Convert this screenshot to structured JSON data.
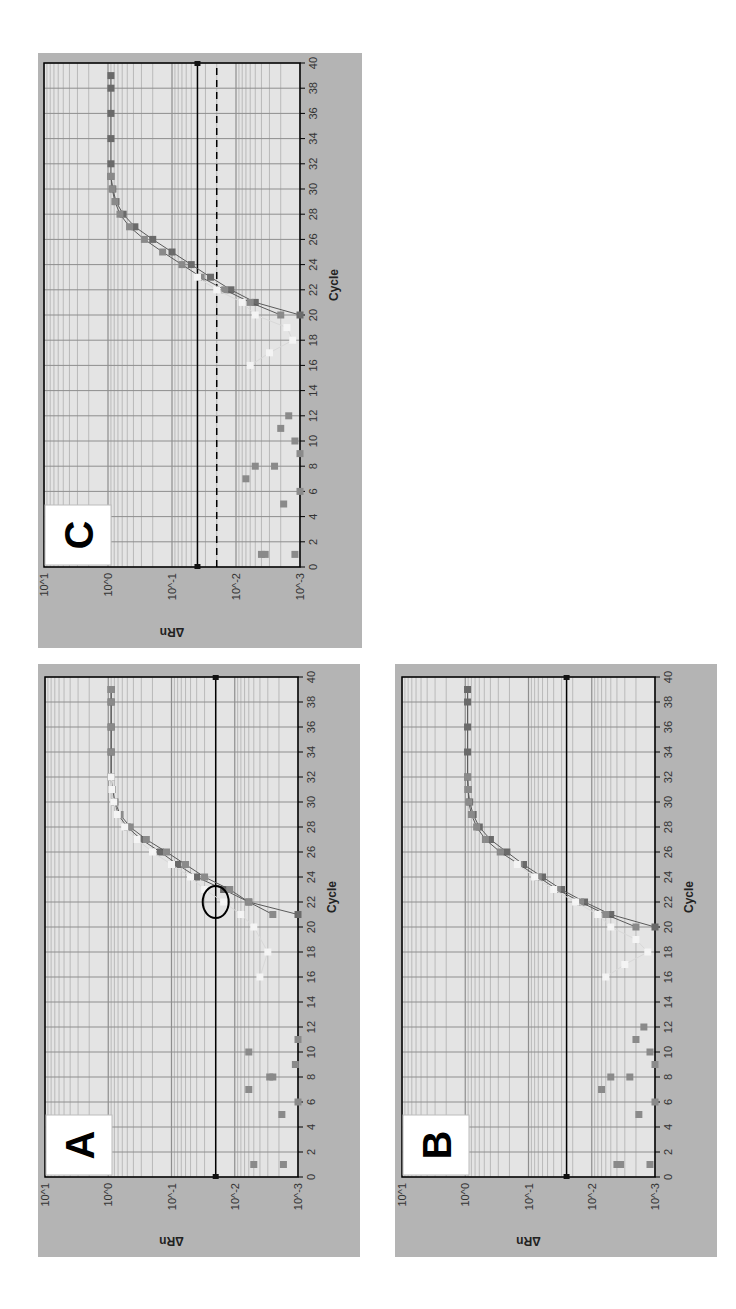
{
  "figure": {
    "panels": [
      {
        "id": "C",
        "label": "C",
        "x": 38,
        "y": 53,
        "w": 324,
        "h": 595,
        "thresholds": [
          {
            "value": 0.04,
            "style": "solid"
          },
          {
            "value": 0.02,
            "style": "dashed"
          }
        ],
        "annotation": null
      },
      {
        "id": "A",
        "label": "A",
        "x": 38,
        "y": 664,
        "w": 322,
        "h": 593,
        "thresholds": [
          {
            "value": 0.02,
            "style": "solid"
          }
        ],
        "annotation": {
          "type": "ellipse",
          "cycle": 22,
          "value": 0.02
        }
      },
      {
        "id": "B",
        "label": "B",
        "x": 395,
        "y": 664,
        "w": 322,
        "h": 593,
        "thresholds": [
          {
            "value": 0.025,
            "style": "solid"
          }
        ],
        "annotation": null
      }
    ],
    "axis_text": {
      "xlabel": "Cycle",
      "ylabel": "ΔRn",
      "xticks": [
        "0",
        "2",
        "4",
        "6",
        "8",
        "10",
        "12",
        "14",
        "16",
        "18",
        "20",
        "22",
        "24",
        "26",
        "28",
        "30",
        "32",
        "34",
        "36",
        "38",
        "40"
      ],
      "yticks": [
        "10^-3",
        "10^-2",
        "10^-1",
        "10^0",
        "10^1"
      ]
    },
    "colors": {
      "frame": "#b4b4b4",
      "plot_bg": "#e4e4e4",
      "grid": "#8e8e8e",
      "minor_grid": "#a8a8a8",
      "series_dark": "#6a6a6a",
      "series_mid": "#8a8a8a",
      "series_light": "#f4f4f4",
      "threshold": "#000000"
    }
  },
  "chart_data": [
    {
      "panel": "A",
      "type": "line",
      "title": "A",
      "xlabel": "Cycle",
      "ylabel": "ΔRn",
      "xlim": [
        0,
        40
      ],
      "ylim": [
        0.001,
        10
      ],
      "yscale": "log",
      "grid": true,
      "threshold": 0.02,
      "annotation": "ellipse near cycle 22 at threshold crossing",
      "series": [
        {
          "name": "sample 1",
          "x": [
            21,
            22,
            23,
            24,
            25,
            26,
            27,
            28,
            29,
            30,
            31,
            32,
            34,
            36,
            38,
            39
          ],
          "values": [
            0.001,
            0.006,
            0.015,
            0.04,
            0.08,
            0.15,
            0.3,
            0.5,
            0.7,
            0.8,
            0.88,
            0.9,
            0.9,
            0.9,
            0.9,
            0.9
          ]
        },
        {
          "name": "sample 2",
          "x": [
            21,
            22,
            23,
            24,
            25,
            26,
            27,
            28,
            29,
            30,
            31,
            32,
            34,
            36,
            38,
            39
          ],
          "values": [
            0.0025,
            0.006,
            0.012,
            0.03,
            0.06,
            0.12,
            0.25,
            0.45,
            0.65,
            0.78,
            0.86,
            0.9,
            0.9,
            0.9,
            0.9,
            0.9
          ]
        },
        {
          "name": "sample 3",
          "x": [
            16,
            18,
            20,
            21,
            22,
            23,
            24,
            25,
            26,
            27,
            28,
            29,
            30,
            31,
            32
          ],
          "values": [
            0.004,
            0.003,
            0.005,
            0.008,
            0.015,
            0.03,
            0.05,
            0.1,
            0.2,
            0.35,
            0.55,
            0.72,
            0.82,
            0.88,
            0.9
          ]
        },
        {
          "name": "early noise",
          "x": [
            1,
            1,
            5,
            6,
            7,
            8,
            8,
            9,
            10,
            11
          ],
          "values": [
            0.005,
            0.0017,
            0.0018,
            0.001,
            0.006,
            0.0025,
            0.0028,
            0.0011,
            0.006,
            0.001
          ]
        }
      ]
    },
    {
      "panel": "B",
      "type": "line",
      "title": "B",
      "xlabel": "Cycle",
      "ylabel": "ΔRn",
      "xlim": [
        0,
        40
      ],
      "ylim": [
        0.001,
        10
      ],
      "yscale": "log",
      "grid": true,
      "threshold": 0.025,
      "series": [
        {
          "name": "sample 1",
          "x": [
            20,
            21,
            22,
            23,
            24,
            25,
            26,
            27,
            28,
            29,
            30,
            31,
            32,
            34,
            36,
            38,
            39
          ],
          "values": [
            0.001,
            0.005,
            0.013,
            0.03,
            0.06,
            0.12,
            0.22,
            0.4,
            0.6,
            0.75,
            0.85,
            0.9,
            0.92,
            0.92,
            0.92,
            0.92,
            0.92
          ]
        },
        {
          "name": "sample 2",
          "x": [
            20,
            21,
            22,
            23,
            24,
            25,
            26,
            27,
            28,
            29,
            30,
            31,
            32
          ],
          "values": [
            0.002,
            0.006,
            0.015,
            0.035,
            0.07,
            0.14,
            0.28,
            0.48,
            0.66,
            0.8,
            0.88,
            0.9,
            0.92
          ]
        },
        {
          "name": "sample 3",
          "x": [
            16,
            17,
            18,
            19,
            20,
            21,
            22,
            23,
            24,
            25
          ],
          "values": [
            0.006,
            0.003,
            0.0013,
            0.002,
            0.005,
            0.008,
            0.018,
            0.04,
            0.08,
            0.15
          ]
        },
        {
          "name": "early noise",
          "x": [
            1,
            1,
            1,
            5,
            6,
            7,
            8,
            8,
            9,
            10,
            11,
            12
          ],
          "values": [
            0.004,
            0.0035,
            0.0012,
            0.0018,
            0.001,
            0.007,
            0.0025,
            0.005,
            0.001,
            0.0012,
            0.002,
            0.0015
          ]
        }
      ]
    },
    {
      "panel": "C",
      "type": "line",
      "title": "C",
      "xlabel": "Cycle",
      "ylabel": "ΔRn",
      "xlim": [
        0,
        40
      ],
      "ylim": [
        0.001,
        10
      ],
      "yscale": "log",
      "grid": true,
      "thresholds": [
        0.04,
        0.02
      ],
      "series": [
        {
          "name": "sample 1",
          "x": [
            20,
            21,
            22,
            23,
            24,
            25,
            26,
            27,
            28,
            29,
            30,
            31,
            32,
            34,
            36,
            38,
            39
          ],
          "values": [
            0.001,
            0.005,
            0.012,
            0.025,
            0.05,
            0.1,
            0.2,
            0.38,
            0.58,
            0.75,
            0.84,
            0.9,
            0.9,
            0.9,
            0.9,
            0.9,
            0.9
          ]
        },
        {
          "name": "sample 2",
          "x": [
            20,
            21,
            22,
            23,
            24,
            25,
            26,
            27,
            28,
            29,
            30,
            31
          ],
          "values": [
            0.002,
            0.006,
            0.015,
            0.035,
            0.07,
            0.14,
            0.27,
            0.46,
            0.65,
            0.78,
            0.86,
            0.9
          ]
        },
        {
          "name": "sample 3",
          "x": [
            16,
            17,
            18,
            19,
            20,
            21,
            22,
            23
          ],
          "values": [
            0.006,
            0.003,
            0.0013,
            0.0016,
            0.005,
            0.008,
            0.02,
            0.04
          ]
        },
        {
          "name": "early noise",
          "x": [
            1,
            1,
            1,
            5,
            6,
            7,
            8,
            8,
            9,
            10,
            11,
            12
          ],
          "values": [
            0.004,
            0.0035,
            0.0012,
            0.0018,
            0.001,
            0.007,
            0.0025,
            0.005,
            0.001,
            0.0012,
            0.002,
            0.0015
          ]
        }
      ]
    }
  ]
}
